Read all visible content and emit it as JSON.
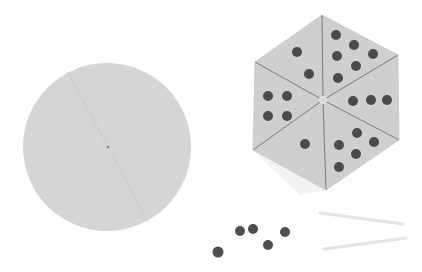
{
  "scene": {
    "description": "Blank circular spinner, hexagonal dot spinner with six segments, loose counters and two sticks",
    "colors": {
      "background": "#ffffff",
      "disc": "#d4d4d4",
      "hexagon": "#cfcfcf",
      "dot": "#4a4a4a",
      "line": "#7a7a7a",
      "stick": "#e6e6e6"
    },
    "hexagon_segments": [
      {
        "position": "top-left",
        "dots": 2
      },
      {
        "position": "top-right",
        "dots": 6
      },
      {
        "position": "right",
        "dots": 3
      },
      {
        "position": "bottom-right",
        "dots": 5
      },
      {
        "position": "bottom-left",
        "dots": 1
      },
      {
        "position": "left",
        "dots": 4
      }
    ],
    "loose_counters": 5,
    "sticks": 2
  }
}
